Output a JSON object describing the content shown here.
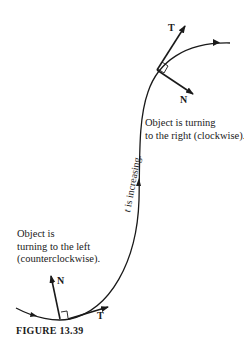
{
  "figure": {
    "caption": "FIGURE 13.39",
    "annotations": {
      "right_turn": [
        "Object is turning",
        "to the right (clockwise)."
      ],
      "left_turn": [
        "Object is",
        "turning to the left",
        "(counterclockwise)."
      ],
      "direction_var": "t",
      "direction_rest": " is increasing."
    },
    "vectors": {
      "top_T": "T",
      "top_N": "N",
      "bottom_T": "T",
      "bottom_N": "N"
    },
    "colors": {
      "ink": "#1a1a1a",
      "background": "#ffffff"
    }
  }
}
